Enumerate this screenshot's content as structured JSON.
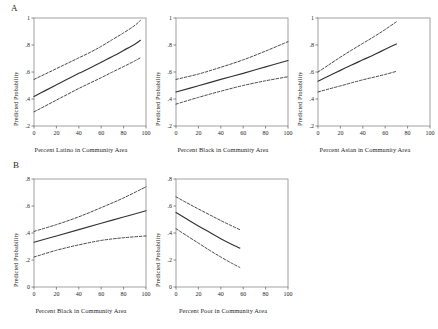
{
  "figure": {
    "panel_a_letter": "A",
    "panel_b_letter": "B",
    "ylabel": "Predicted Probability"
  },
  "chart_data": [
    {
      "id": "a1",
      "panel": "A",
      "type": "line",
      "title": "",
      "xlabel": "Percent Latino in Community Area",
      "ylabel": "Predicted Probability",
      "xlim": [
        0,
        100
      ],
      "ylim": [
        0.2,
        1.0
      ],
      "xticks": [
        0,
        20,
        40,
        60,
        80,
        100
      ],
      "xtick_labels": [
        "0",
        "20",
        "40",
        "60",
        "80",
        "100"
      ],
      "yticks": [
        0.2,
        0.4,
        0.6,
        0.8,
        1.0
      ],
      "ytick_labels": [
        ".2",
        ".4",
        ".6",
        ".8",
        "1"
      ],
      "grid": false,
      "legend": "none",
      "series": [
        {
          "name": "Upper 95% CI",
          "style": "dashed",
          "x": [
            0,
            10,
            20,
            30,
            40,
            50,
            60,
            70,
            80,
            90,
            95
          ],
          "values": [
            0.545,
            0.585,
            0.625,
            0.665,
            0.705,
            0.745,
            0.79,
            0.84,
            0.89,
            0.945,
            0.982
          ]
        },
        {
          "name": "Predicted probability",
          "style": "solid",
          "x": [
            0,
            10,
            20,
            30,
            40,
            50,
            60,
            70,
            80,
            90,
            95
          ],
          "values": [
            0.418,
            0.462,
            0.505,
            0.548,
            0.59,
            0.63,
            0.673,
            0.715,
            0.76,
            0.806,
            0.835
          ]
        },
        {
          "name": "Lower 95% CI",
          "style": "dashed",
          "x": [
            0,
            10,
            20,
            30,
            40,
            50,
            60,
            70,
            80,
            90,
            95
          ],
          "values": [
            0.305,
            0.348,
            0.392,
            0.435,
            0.478,
            0.518,
            0.558,
            0.6,
            0.64,
            0.682,
            0.705
          ]
        }
      ]
    },
    {
      "id": "a2",
      "panel": "A",
      "type": "line",
      "title": "",
      "xlabel": "Percent Black in Community Area",
      "ylabel": "Predicted Probability",
      "xlim": [
        0,
        100
      ],
      "ylim": [
        0.2,
        1.0
      ],
      "xticks": [
        0,
        20,
        40,
        60,
        80,
        100
      ],
      "xtick_labels": [
        "0",
        "20",
        "40",
        "60",
        "80",
        "100"
      ],
      "yticks": [
        0.2,
        0.4,
        0.6,
        0.8,
        1.0
      ],
      "ytick_labels": [
        ".2",
        ".4",
        ".6",
        ".8",
        "1"
      ],
      "grid": false,
      "legend": "none",
      "series": [
        {
          "name": "Upper 95% CI",
          "style": "dashed",
          "x": [
            0,
            20,
            40,
            60,
            80,
            100
          ],
          "values": [
            0.545,
            0.585,
            0.635,
            0.69,
            0.755,
            0.825
          ]
        },
        {
          "name": "Predicted probability",
          "style": "solid",
          "x": [
            0,
            20,
            40,
            60,
            80,
            100
          ],
          "values": [
            0.452,
            0.498,
            0.545,
            0.59,
            0.638,
            0.685
          ]
        },
        {
          "name": "Lower 95% CI",
          "style": "dashed",
          "x": [
            0,
            20,
            40,
            60,
            80,
            100
          ],
          "values": [
            0.362,
            0.412,
            0.458,
            0.5,
            0.535,
            0.565
          ]
        }
      ]
    },
    {
      "id": "a3",
      "panel": "A",
      "type": "line",
      "title": "",
      "xlabel": "Percent Asian in Community Area",
      "ylabel": "Predicted Probability",
      "xlim": [
        0,
        100
      ],
      "ylim": [
        0.2,
        1.0
      ],
      "xticks": [
        0,
        20,
        40,
        60,
        80,
        100
      ],
      "xtick_labels": [
        "0",
        "20",
        "40",
        "60",
        "80",
        "100"
      ],
      "yticks": [
        0.2,
        0.4,
        0.6,
        0.8,
        1.0
      ],
      "ytick_labels": [
        ".2",
        ".4",
        ".6",
        ".8",
        "1"
      ],
      "grid": false,
      "legend": "none",
      "series": [
        {
          "name": "Upper 95% CI",
          "style": "dashed",
          "x": [
            0,
            10,
            20,
            30,
            40,
            50,
            60,
            70
          ],
          "values": [
            0.6,
            0.655,
            0.71,
            0.762,
            0.812,
            0.862,
            0.915,
            0.972
          ]
        },
        {
          "name": "Predicted probability",
          "style": "solid",
          "x": [
            0,
            10,
            20,
            30,
            40,
            50,
            60,
            70
          ],
          "values": [
            0.532,
            0.572,
            0.612,
            0.652,
            0.69,
            0.728,
            0.768,
            0.808
          ]
        },
        {
          "name": "Lower 95% CI",
          "style": "dashed",
          "x": [
            0,
            10,
            20,
            30,
            40,
            50,
            60,
            70
          ],
          "values": [
            0.452,
            0.475,
            0.497,
            0.52,
            0.542,
            0.562,
            0.582,
            0.605
          ]
        }
      ]
    },
    {
      "id": "b1",
      "panel": "B",
      "type": "line",
      "title": "",
      "xlabel": "Percent Black in Community Area",
      "ylabel": "Predicted Probability",
      "xlim": [
        0,
        100
      ],
      "ylim": [
        0.0,
        0.8
      ],
      "xticks": [
        0,
        20,
        40,
        60,
        80,
        100
      ],
      "xtick_labels": [
        "0",
        "20",
        "40",
        "60",
        "80",
        "100"
      ],
      "yticks": [
        0.0,
        0.2,
        0.4,
        0.6,
        0.8
      ],
      "ytick_labels": [
        "0",
        ".2",
        ".4",
        ".6",
        ".8"
      ],
      "grid": false,
      "legend": "none",
      "series": [
        {
          "name": "Upper 95% CI",
          "style": "dashed",
          "x": [
            0,
            20,
            40,
            60,
            80,
            100
          ],
          "values": [
            0.412,
            0.462,
            0.52,
            0.588,
            0.66,
            0.742
          ]
        },
        {
          "name": "Predicted probability",
          "style": "solid",
          "x": [
            0,
            20,
            40,
            60,
            80,
            100
          ],
          "values": [
            0.332,
            0.378,
            0.425,
            0.472,
            0.518,
            0.565
          ]
        },
        {
          "name": "Lower 95% CI",
          "style": "dashed",
          "x": [
            0,
            20,
            40,
            60,
            80,
            100
          ],
          "values": [
            0.222,
            0.272,
            0.312,
            0.345,
            0.365,
            0.378
          ]
        }
      ]
    },
    {
      "id": "b2",
      "panel": "B",
      "type": "line",
      "title": "",
      "xlabel": "Percent Poor in Community Area",
      "ylabel": "Predicted Probability",
      "xlim": [
        0,
        100
      ],
      "ylim": [
        0.0,
        0.8
      ],
      "xticks": [
        0,
        20,
        40,
        60,
        80,
        100
      ],
      "xtick_labels": [
        "0",
        "20",
        "40",
        "60",
        "80",
        "100"
      ],
      "yticks": [
        0.0,
        0.2,
        0.4,
        0.6,
        0.8
      ],
      "ytick_labels": [
        "0",
        ".2",
        ".4",
        ".6",
        ".8"
      ],
      "grid": false,
      "legend": "none",
      "series": [
        {
          "name": "Upper 95% CI",
          "style": "dashed",
          "x": [
            0,
            10,
            20,
            30,
            40,
            50,
            57
          ],
          "values": [
            0.668,
            0.622,
            0.578,
            0.535,
            0.492,
            0.452,
            0.425
          ]
        },
        {
          "name": "Predicted probability",
          "style": "solid",
          "x": [
            0,
            10,
            20,
            30,
            40,
            50,
            57
          ],
          "values": [
            0.552,
            0.502,
            0.452,
            0.405,
            0.358,
            0.315,
            0.288
          ]
        },
        {
          "name": "Lower 95% CI",
          "style": "dashed",
          "x": [
            0,
            10,
            20,
            30,
            40,
            50,
            57
          ],
          "values": [
            0.432,
            0.378,
            0.325,
            0.272,
            0.222,
            0.175,
            0.145
          ]
        }
      ]
    }
  ]
}
